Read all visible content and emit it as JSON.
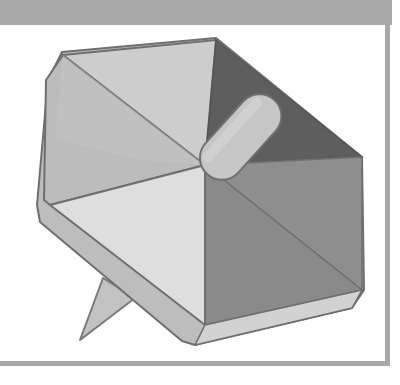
{
  "figure": {
    "colors": {
      "header_band": "#a9a9a9",
      "frame_border": "#a8a8a8",
      "rim": "#bdbdbd",
      "outline": "#6f6f6f",
      "face_top_left": "#c4c4c4",
      "face_top": "#cdcdcd",
      "face_top_right_dark": "#5e5e5e",
      "face_right": "#8c8c8c",
      "face_bottom_right": "#8a8a8a",
      "face_bottom_left_light": "#dedede",
      "face_left": "#bcbcbc",
      "rod": "#c6c6c6",
      "stand": "#c2c2c2"
    }
  }
}
